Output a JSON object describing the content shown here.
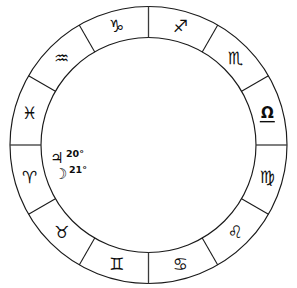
{
  "chart_data": {
    "type": "pie",
    "subtitle": "",
    "xlabel": "",
    "ylabel": "",
    "legend_position": "none",
    "grid": false,
    "slice_count": 12,
    "slice_degrees": 30,
    "direction": "counter-clockwise",
    "categories": [
      "Aries",
      "Taurus",
      "Gemini",
      "Cancer",
      "Leo",
      "Virgo",
      "Libra",
      "Scorpio",
      "Sagittarius",
      "Capricorn",
      "Aquarius",
      "Pisces"
    ],
    "values": [
      30,
      30,
      30,
      30,
      30,
      30,
      30,
      30,
      30,
      30,
      30,
      30
    ],
    "annotations": [
      "♃ 20°",
      "☽ 21°"
    ]
  },
  "wheel": {
    "center_x": 148.5,
    "center_y": 145.0,
    "outer_radius": 138.5,
    "inner_radius": 107.5,
    "glyph_radius": 123.0,
    "stroke_color": "#1a1a1a",
    "fill_color": "#ffffff",
    "text_color": "#0d0d0d",
    "accent_color": "#3a3a3a"
  },
  "signs": [
    {
      "name": "Aries",
      "glyph": "♈",
      "start_deg": 180,
      "mid_deg": 195,
      "glyph_size": 17
    },
    {
      "name": "Taurus",
      "glyph": "♉",
      "start_deg": 210,
      "mid_deg": 225,
      "glyph_size": 17
    },
    {
      "name": "Gemini",
      "glyph": "♊",
      "start_deg": 240,
      "mid_deg": 255,
      "glyph_size": 17
    },
    {
      "name": "Cancer",
      "glyph": "♋",
      "start_deg": 270,
      "mid_deg": 285,
      "glyph_size": 17
    },
    {
      "name": "Leo",
      "glyph": "♌",
      "start_deg": 300,
      "mid_deg": 315,
      "glyph_size": 17
    },
    {
      "name": "Virgo",
      "glyph": "♍",
      "start_deg": 330,
      "mid_deg": 345,
      "glyph_size": 16
    },
    {
      "name": "Libra",
      "glyph": "Ω",
      "start_deg": 0,
      "mid_deg": 15,
      "glyph_size": 15
    },
    {
      "name": "Scorpio",
      "glyph": "♏",
      "start_deg": 30,
      "mid_deg": 45,
      "glyph_size": 16
    },
    {
      "name": "Sagittarius",
      "glyph": "♐",
      "start_deg": 60,
      "mid_deg": 75,
      "glyph_size": 17
    },
    {
      "name": "Capricorn",
      "glyph": "♑",
      "start_deg": 90,
      "mid_deg": 105,
      "glyph_size": 17
    },
    {
      "name": "Aquarius",
      "glyph": "♒",
      "start_deg": 120,
      "mid_deg": 135,
      "glyph_size": 17
    },
    {
      "name": "Pisces",
      "glyph": "♓",
      "start_deg": 150,
      "mid_deg": 165,
      "glyph_size": 16
    }
  ],
  "planets": [
    {
      "name": "Jupiter",
      "glyph": "♃",
      "degree_label": "20°",
      "glyph_x": 50,
      "glyph_y": 158,
      "degree_x": 66,
      "degree_y": 153
    },
    {
      "name": "Moon",
      "glyph": "☽",
      "degree_label": "21°",
      "glyph_x": 54,
      "glyph_y": 174,
      "degree_x": 69,
      "degree_y": 169
    }
  ]
}
